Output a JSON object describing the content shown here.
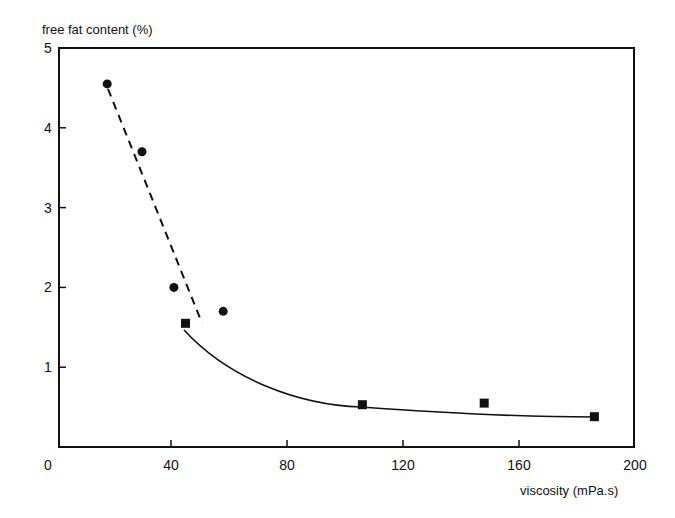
{
  "chart_data": {
    "type": "scatter",
    "title": "",
    "xlabel": "viscosity (mPa.s)",
    "ylabel": "free fat content (%)",
    "xlim": [
      0,
      200
    ],
    "ylim": [
      0,
      5
    ],
    "x_ticks": [
      "0",
      "40",
      "80",
      "120",
      "160",
      "200"
    ],
    "y_ticks": [
      "1",
      "2",
      "3",
      "4",
      "5"
    ],
    "grid": false,
    "legend": null,
    "series": [
      {
        "name": "circles",
        "marker": "circle",
        "fit_line": "dashed",
        "points": [
          {
            "x": 18,
            "y": 4.55
          },
          {
            "x": 30,
            "y": 3.7
          },
          {
            "x": 41,
            "y": 2.0
          },
          {
            "x": 58,
            "y": 1.7
          }
        ]
      },
      {
        "name": "squares",
        "marker": "square",
        "fit_line": "solid-curve",
        "points": [
          {
            "x": 45,
            "y": 1.55
          },
          {
            "x": 106,
            "y": 0.53
          },
          {
            "x": 148,
            "y": 0.55
          },
          {
            "x": 186,
            "y": 0.38
          }
        ]
      }
    ]
  }
}
